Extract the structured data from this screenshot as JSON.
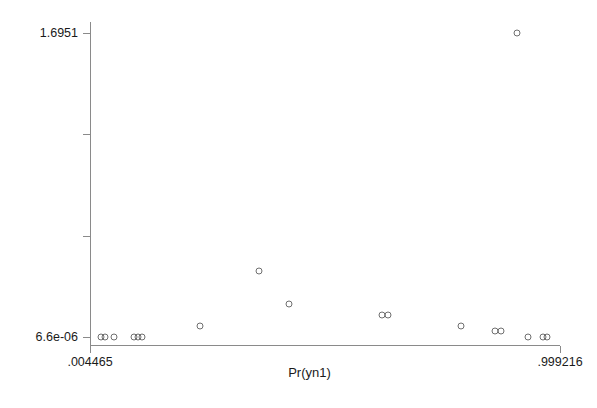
{
  "chart_data": {
    "type": "scatter",
    "title": "",
    "xlabel": "Pr(yn1)",
    "ylabel": "",
    "grid": false,
    "legend": null,
    "xlim": [
      0.004465,
      0.999216
    ],
    "ylim": [
      6.6e-06,
      1.6951
    ],
    "xticks": [
      {
        "value": 0.004465,
        "label": ".004465"
      },
      {
        "value": 0.999216,
        "label": ".999216"
      }
    ],
    "yticks": [
      {
        "value": 1.6951,
        "label": "1.6951"
      },
      {
        "value": 1.1294,
        "label": ""
      },
      {
        "value": 0.5647,
        "label": ""
      },
      {
        "value": 6.6e-06,
        "label": "6.6e-06"
      }
    ],
    "marker": "open-circle",
    "marker_color": "#6f6f6f",
    "points": [
      {
        "x": 0.0268,
        "y": 6.6e-06
      },
      {
        "x": 0.0372,
        "y": 6.6e-06
      },
      {
        "x": 0.0558,
        "y": 6.6e-06
      },
      {
        "x": 0.0972,
        "y": 6.6e-06
      },
      {
        "x": 0.1055,
        "y": 6.6e-06
      },
      {
        "x": 0.1138,
        "y": 6.6e-06
      },
      {
        "x": 0.2375,
        "y": 0.0613
      },
      {
        "x": 0.3612,
        "y": 0.3681
      },
      {
        "x": 0.425,
        "y": 0.184
      },
      {
        "x": 0.623,
        "y": 0.1226
      },
      {
        "x": 0.6354,
        "y": 0.1226
      },
      {
        "x": 0.79,
        "y": 0.0613
      },
      {
        "x": 0.862,
        "y": 0.0307
      },
      {
        "x": 0.8745,
        "y": 0.0307
      },
      {
        "x": 0.932,
        "y": 6.6e-06
      },
      {
        "x": 0.963,
        "y": 6.6e-06
      },
      {
        "x": 0.9712,
        "y": 6.6e-06
      },
      {
        "x": 0.9092,
        "y": 1.6951
      }
    ]
  }
}
